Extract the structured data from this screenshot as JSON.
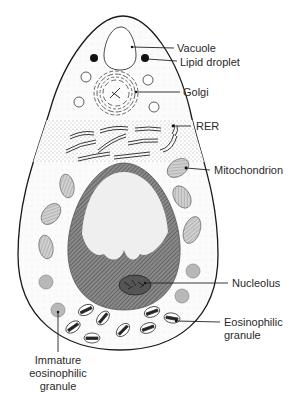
{
  "figure": {
    "type": "cell-diagram"
  },
  "labels": {
    "vacuole": "Vacuole",
    "lipid_droplet": "Lipid droplet",
    "golgi": "Golgi",
    "rer": "RER",
    "mitochondrion": "Mitochondrion",
    "nucleolus": "Nucleolus",
    "eosinophilic_granule_line1": "Eosinophilic",
    "eosinophilic_granule_line2": "granule",
    "immature_line1": "Immature",
    "immature_line2": "eosinophilic",
    "immature_line3": "granule"
  },
  "colors": {
    "outline": "#1a1a1a",
    "background": "#ffffff",
    "cytoplasm": "#f4f4f4",
    "rer_stipple": "#d9d9d9",
    "nucleus_dark": "#6e6e6e",
    "nucleus_light": "#efefef",
    "mitochondrion": "#bdbdbd",
    "immature_granule": "#b5b5b5",
    "lipid_droplet": "#111111",
    "text": "#2a2a2a"
  }
}
